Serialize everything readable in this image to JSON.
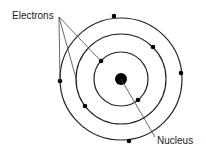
{
  "diagram": {
    "labels": {
      "electrons": "Electrons",
      "nucleus": "Nucleus"
    },
    "nucleus": {
      "cx": 121,
      "cy": 79,
      "r": 6
    },
    "orbits": [
      {
        "name": "inner",
        "r": 27
      },
      {
        "name": "middle",
        "r": 45
      },
      {
        "name": "outer",
        "r": 61
      }
    ],
    "electrons": [
      {
        "orbit": "inner",
        "x": 101,
        "y": 61
      },
      {
        "orbit": "inner",
        "x": 138,
        "y": 100
      },
      {
        "orbit": "middle",
        "x": 153,
        "y": 47
      },
      {
        "orbit": "middle",
        "x": 85,
        "y": 106
      },
      {
        "orbit": "outer",
        "x": 114,
        "y": 16
      },
      {
        "orbit": "outer",
        "x": 181,
        "y": 73
      },
      {
        "orbit": "outer",
        "x": 60,
        "y": 81
      },
      {
        "orbit": "outer",
        "x": 129,
        "y": 141
      }
    ],
    "colors": {
      "stroke": "#222222",
      "background": "#ffffff"
    }
  }
}
